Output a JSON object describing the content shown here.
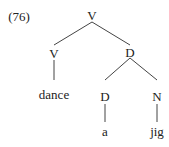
{
  "example_number": "(76)",
  "tree": {
    "root": "V",
    "left": {
      "label": "V",
      "word": "dance"
    },
    "right": {
      "label": "D",
      "left": {
        "label": "D",
        "word": "a"
      },
      "right": {
        "label": "N",
        "word": "jig"
      }
    }
  }
}
